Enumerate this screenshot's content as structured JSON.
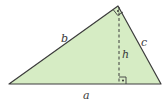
{
  "diagram": {
    "type": "right-triangle-with-altitude",
    "fill_color": "#d6ecc4",
    "stroke_color": "#3c3c3c",
    "vertices": {
      "left": [
        9,
        84
      ],
      "apex": [
        118,
        6
      ],
      "right": [
        161,
        84
      ],
      "altitude_foot": [
        119,
        84
      ]
    },
    "labels": {
      "side_a": "a",
      "side_b": "b",
      "side_c": "c",
      "altitude_h": "h"
    },
    "right_angle_markers": [
      "apex",
      "altitude_foot"
    ]
  }
}
